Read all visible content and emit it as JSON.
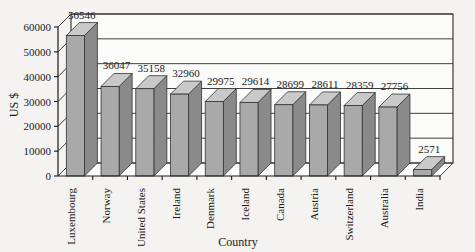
{
  "chart_data": {
    "type": "bar",
    "title": "",
    "xlabel": "Country",
    "ylabel": "US $",
    "categories": [
      "Luxembourg",
      "Norway",
      "United States",
      "Ireland",
      "Denmark",
      "Iceland",
      "Canada",
      "Austria",
      "Switzerland",
      "Australia",
      "India"
    ],
    "values": [
      56546,
      36047,
      35158,
      32960,
      29975,
      29614,
      28699,
      28611,
      28359,
      27756,
      2571
    ],
    "value_labels": [
      "56546",
      "36047",
      "35158",
      "32960",
      "29975",
      "29614",
      "28699",
      "28611",
      "28359",
      "27756",
      "2571"
    ],
    "ylim": [
      0,
      60000
    ],
    "ytick_values": [
      0,
      10000,
      20000,
      30000,
      40000,
      50000,
      60000
    ],
    "ytick_labels": [
      "0",
      "10000",
      "20000",
      "30000",
      "40000",
      "50000",
      "60000"
    ],
    "grid": true,
    "grid_axis": "y",
    "legend": false,
    "legend_position": "none",
    "style": "3d-column",
    "colors": {
      "bar_front": "#a9a9a9",
      "bar_side": "#8a8a8a",
      "bar_top": "#c9c9c9",
      "axis": "#1a1a1a",
      "grid": "#2b2b2b",
      "background": "#f4f3f1",
      "plot_background": "#fbfbfa"
    }
  }
}
